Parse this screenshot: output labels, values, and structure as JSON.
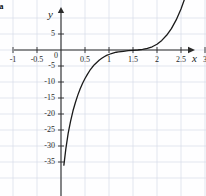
{
  "figure": {
    "corner_label": "a",
    "background_color": "#fefeff",
    "grid_color": "#d7dce8",
    "axis_color": "#2b2b2b",
    "curve_color": "#1a1a1a"
  },
  "chart_data": {
    "type": "line",
    "title": "",
    "xlabel": "x",
    "ylabel": "y",
    "xlim": [
      -1.3,
      3.5
    ],
    "ylim": [
      -37,
      8
    ],
    "grid": true,
    "legend": "none",
    "x_ticks": [
      -1,
      -0.5,
      0,
      0.5,
      1,
      1.5,
      2,
      2.5,
      3
    ],
    "x_tick_labels": [
      "-1",
      "-0.5",
      "0",
      "0.5",
      "1",
      "1.5",
      "2",
      "2.5",
      "3"
    ],
    "y_ticks": [
      5,
      -5,
      -10,
      -15,
      -20,
      -25,
      -30,
      -35
    ],
    "y_tick_labels": [
      "5",
      "-5",
      "-10",
      "-15",
      "-20",
      "-25",
      "-30",
      "-35"
    ],
    "origin_label": "0",
    "series": [
      {
        "name": "curve",
        "x": [
          0.06,
          0.1,
          0.15,
          0.2,
          0.25,
          0.3,
          0.35,
          0.4,
          0.45,
          0.5,
          0.55,
          0.6,
          0.65,
          0.7,
          0.75,
          0.8,
          0.85,
          0.9,
          0.95,
          1.0,
          1.05,
          1.1,
          1.15,
          1.2,
          1.3,
          1.4,
          1.5,
          1.6,
          1.7,
          1.8,
          1.9,
          2.0,
          2.1,
          2.2,
          2.3,
          2.4,
          2.5,
          2.6,
          2.7
        ],
        "y": [
          -36.0,
          -31.0,
          -26.0,
          -22.2,
          -19.0,
          -16.4,
          -14.1,
          -12.1,
          -10.4,
          -8.9,
          -7.6,
          -6.4,
          -5.4,
          -4.5,
          -3.8,
          -3.1,
          -2.6,
          -2.1,
          -1.7,
          -1.4,
          -1.1,
          -0.9,
          -0.7,
          -0.6,
          -0.4,
          -0.2,
          -0.1,
          0.0,
          0.2,
          0.5,
          1.0,
          1.8,
          3.0,
          4.6,
          6.7,
          9.4,
          12.8,
          17.0,
          22.0
        ]
      }
    ]
  }
}
